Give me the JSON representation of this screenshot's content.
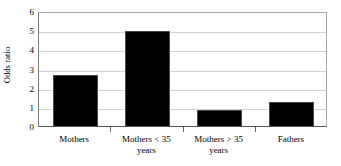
{
  "chart_data": {
    "type": "bar",
    "title": "",
    "xlabel": "",
    "ylabel": "Odds ratio",
    "categories": [
      "Mothers",
      "Mothers < 35 years",
      "Mothers > 35 years",
      "Fathers"
    ],
    "values": [
      2.65,
      4.95,
      0.83,
      1.25
    ],
    "ylim": [
      0,
      6
    ],
    "ytick_labels": [
      "0",
      "1",
      "2",
      "3",
      "4",
      "5",
      "6"
    ],
    "ytick_values": [
      0,
      1,
      2,
      3,
      4,
      5,
      6
    ],
    "grid": true,
    "legend": "none",
    "bar_color": "#000000",
    "gridline_color": "#d0d0d0",
    "axis_color": "#555555",
    "background_color": "#ffffff",
    "category_lines": [
      [
        "Mothers"
      ],
      [
        "Mothers < 35",
        "years"
      ],
      [
        "Mothers > 35",
        "years"
      ],
      [
        "Fathers"
      ]
    ]
  }
}
